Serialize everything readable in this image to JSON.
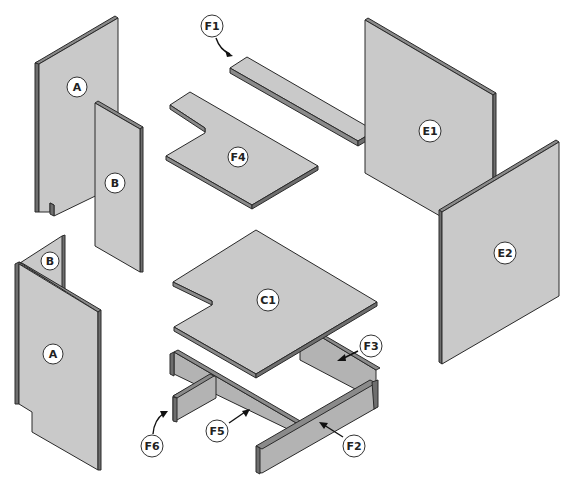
{
  "diagram": {
    "title": "",
    "type": "exploded assembly view",
    "background": "#ffffff",
    "colors": {
      "panel_face": "#c9c9c9",
      "panel_edge": "#8a8a8a",
      "outline": "#2a2a2a"
    },
    "parts": [
      {
        "id": "A_top",
        "label": "A",
        "description": "upright side panel with notch (upper left)"
      },
      {
        "id": "B_top",
        "label": "B",
        "description": "narrow upright panel (upper left)"
      },
      {
        "id": "B_bottom",
        "label": "B",
        "description": "narrow panel joined to A (lower left)"
      },
      {
        "id": "A_bottom",
        "label": "A",
        "description": "side panel with notch (lower left)"
      },
      {
        "id": "F1",
        "label": "F1",
        "description": "long rail strip"
      },
      {
        "id": "F4",
        "label": "F4",
        "description": "notched shelf board"
      },
      {
        "id": "E1",
        "label": "E1",
        "description": "large upright panel"
      },
      {
        "id": "E2",
        "label": "E2",
        "description": "large upright panel"
      },
      {
        "id": "C1",
        "label": "C1",
        "description": "notched top/base board"
      },
      {
        "id": "F2",
        "label": "F2",
        "description": "frame rail (front)"
      },
      {
        "id": "F3",
        "label": "F3",
        "description": "frame rail (back)"
      },
      {
        "id": "F5",
        "label": "F5",
        "description": "frame rail (middle)"
      },
      {
        "id": "F6",
        "label": "F6",
        "description": "short cross rail"
      }
    ],
    "callouts": {
      "A_top": "A",
      "B_top": "B",
      "B_bottom": "B",
      "A_bottom": "A",
      "F1": "F1",
      "F4": "F4",
      "E1": "E1",
      "E2": "E2",
      "C1": "C1",
      "F3": "F3",
      "F5": "F5",
      "F6": "F6",
      "F2": "F2"
    }
  }
}
